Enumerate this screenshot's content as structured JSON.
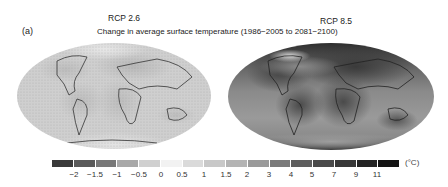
{
  "panel_label": "(a)",
  "title": "Change in average surface temperature (1986−2005 to 2081−2100)",
  "maps": [
    {
      "scenario": "RCP 2.6",
      "model_count": "32"
    },
    {
      "scenario": "RCP 8.5",
      "model_count": "39"
    }
  ],
  "colorbar": {
    "unit": "(°C)",
    "ticks": [
      "−2",
      "−1.5",
      "−1",
      "−0.5",
      "0",
      "0.5",
      "1",
      "1.5",
      "2",
      "3",
      "4",
      "5",
      "7",
      "9",
      "11"
    ],
    "colors": [
      "#3a3a3a",
      "#5a5a5a",
      "#787878",
      "#a8a8a8",
      "#d0d0d0",
      "#f2f2f2",
      "#dadada",
      "#c8c8c8",
      "#b4b4b4",
      "#9a9a9a",
      "#7a7a7a",
      "#5e5e5e",
      "#4a4a4a",
      "#383838",
      "#242424",
      "#141414"
    ]
  }
}
